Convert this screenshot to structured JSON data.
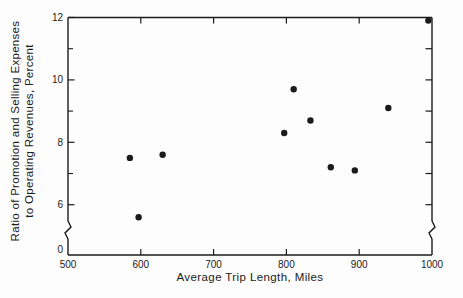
{
  "figure": {
    "background": "#fdfdfd",
    "ink": "#1b1b1b"
  },
  "chart_data": {
    "type": "scatter",
    "title": "",
    "xlabel": "Average Trip Length, Miles",
    "ylabel": "Ratio of Promotion and Selling Expenses to Operating Revenues, Percent",
    "ylabel_lines": [
      "Ratio of Promotion and Selling Expenses",
      "to Operating Revenues, Percent"
    ],
    "xlim": [
      500,
      1000
    ],
    "ylim": [
      0,
      12
    ],
    "y_axis_break": {
      "between": [
        0,
        5
      ]
    },
    "x_tick_labels": [
      500,
      600,
      700,
      800,
      900,
      1000
    ],
    "x_inner_ticks": [
      600,
      700,
      800,
      900
    ],
    "y_major_ticks": [
      12,
      10,
      8,
      6
    ],
    "y_minor_ticks": [
      11,
      9,
      7
    ],
    "y_right_ticks": [
      11,
      10,
      9,
      8,
      7,
      6
    ],
    "y_zero_label": "0",
    "grid": false,
    "legend": null,
    "marker": {
      "shape": "circle",
      "color": "#1b1b1b",
      "radius": 3.2
    },
    "points": [
      {
        "x": 585,
        "y": 7.5
      },
      {
        "x": 597,
        "y": 5.6
      },
      {
        "x": 630,
        "y": 7.6
      },
      {
        "x": 797,
        "y": 8.3
      },
      {
        "x": 810,
        "y": 9.7
      },
      {
        "x": 833,
        "y": 8.7
      },
      {
        "x": 861,
        "y": 7.2
      },
      {
        "x": 894,
        "y": 7.1
      },
      {
        "x": 940,
        "y": 9.1
      },
      {
        "x": 995,
        "y": 11.9
      }
    ]
  }
}
